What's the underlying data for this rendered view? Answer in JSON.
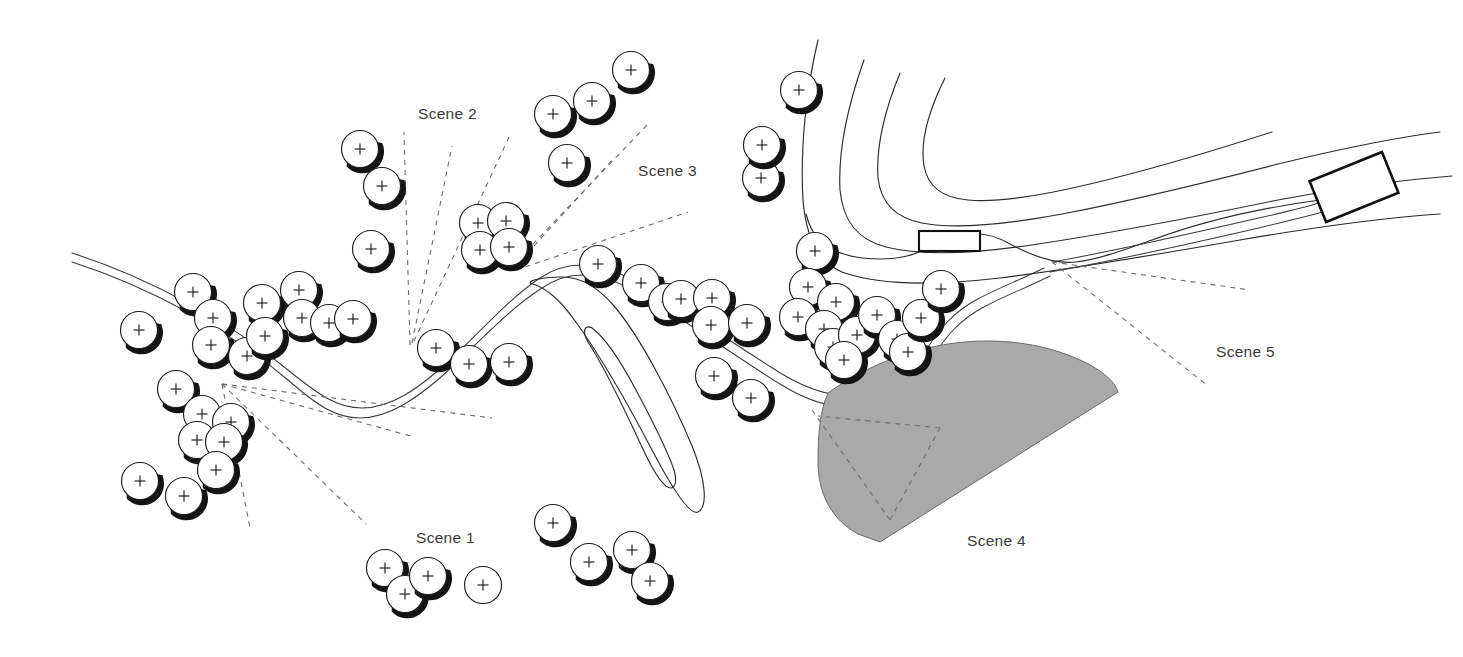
{
  "diagram": {
    "type": "topographic-map",
    "width": 1463,
    "height": 657,
    "background_color": "#ffffff"
  },
  "colors": {
    "background": "#ffffff",
    "contour_stroke": "#2b2b2b",
    "road_stroke": "#3a3a3a",
    "view_ray_stroke": "#6e6e6e",
    "scene4_fill": "#a9a9a9",
    "scene4_stroke": "#6a6a6a",
    "label_text": "#3b3b3b",
    "tree_fill": "#ffffff",
    "tree_stroke": "#1d1d1d",
    "tree_shadow": "#141414",
    "building_stroke": "#111111"
  },
  "labels": [
    {
      "id": "scene-1",
      "text": "Scene 1",
      "x": 416,
      "y": 543,
      "anchor": "start"
    },
    {
      "id": "scene-2",
      "text": "Scene 2",
      "x": 418,
      "y": 119,
      "anchor": "start"
    },
    {
      "id": "scene-3",
      "text": "Scene 3",
      "x": 638,
      "y": 176,
      "anchor": "start"
    },
    {
      "id": "scene-4",
      "text": "Scene 4",
      "x": 967,
      "y": 546,
      "anchor": "start"
    },
    {
      "id": "scene-5",
      "text": "Scene 5",
      "x": 1216,
      "y": 357,
      "anchor": "start"
    }
  ],
  "symbols": {
    "tree": {
      "name": "tree-symbol",
      "glyph": "+",
      "radius": 18.5,
      "count": 69
    },
    "building": {
      "name": "building-symbol",
      "shape": "rectangle"
    }
  },
  "trees": [
    [
      139,
      330
    ],
    [
      193,
      292
    ],
    [
      213,
      318
    ],
    [
      211,
      345
    ],
    [
      247,
      356
    ],
    [
      262,
      303
    ],
    [
      265,
      336
    ],
    [
      299,
      290
    ],
    [
      302,
      318
    ],
    [
      329,
      323
    ],
    [
      353,
      319
    ],
    [
      360,
      149
    ],
    [
      382,
      186
    ],
    [
      371,
      249
    ],
    [
      176,
      389
    ],
    [
      202,
      414
    ],
    [
      231,
      422
    ],
    [
      197,
      440
    ],
    [
      224,
      442
    ],
    [
      216,
      470
    ],
    [
      140,
      481
    ],
    [
      184,
      496
    ],
    [
      436,
      348
    ],
    [
      469,
      364
    ],
    [
      509,
      362
    ],
    [
      478,
      223
    ],
    [
      506,
      221
    ],
    [
      480,
      250
    ],
    [
      509,
      247
    ],
    [
      553,
      114
    ],
    [
      592,
      101
    ],
    [
      631,
      70
    ],
    [
      567,
      163
    ],
    [
      598,
      264
    ],
    [
      641,
      283
    ],
    [
      667,
      302
    ],
    [
      681,
      299
    ],
    [
      712,
      298
    ],
    [
      711,
      325
    ],
    [
      747,
      323
    ],
    [
      714,
      376
    ],
    [
      751,
      398
    ],
    [
      761,
      178
    ],
    [
      762,
      145
    ],
    [
      799,
      90
    ],
    [
      815,
      251
    ],
    [
      808,
      287
    ],
    [
      836,
      302
    ],
    [
      798,
      317
    ],
    [
      824,
      329
    ],
    [
      833,
      347
    ],
    [
      857,
      335
    ],
    [
      844,
      360
    ],
    [
      877,
      315
    ],
    [
      897,
      339
    ],
    [
      908,
      352
    ],
    [
      921,
      318
    ],
    [
      941,
      289
    ],
    [
      385,
      568
    ],
    [
      405,
      594
    ],
    [
      428,
      576
    ],
    [
      483,
      585
    ],
    [
      553,
      523
    ],
    [
      589,
      562
    ],
    [
      632,
      550
    ],
    [
      650,
      581
    ],
    [
      140,
      481
    ],
    [
      184,
      496
    ],
    [
      216,
      470
    ]
  ],
  "trees_no_shadow": [
    [
      483,
      585
    ]
  ],
  "view_cones": [
    {
      "id": "scene-1-cone",
      "apex": [
        222,
        384
      ],
      "rays": [
        [
          489,
          417
        ],
        [
          414,
          437
        ],
        [
          366,
          524
        ],
        [
          250,
          528
        ]
      ]
    },
    {
      "id": "scene-2-cone",
      "apex": [
        412,
        343
      ],
      "rays": [
        [
          404,
          135
        ],
        [
          450,
          147
        ],
        [
          508,
          136
        ]
      ]
    },
    {
      "id": "scene-3-cone",
      "apex": [
        512,
        266
      ],
      "rays": [
        [
          646,
          127
        ],
        [
          686,
          213
        ],
        [
          612,
          156
        ]
      ]
    },
    {
      "id": "scene-4-cone",
      "apex": [
        890,
        520
      ],
      "rays": [
        [
          938,
          429
        ],
        [
          812,
          411
        ]
      ]
    },
    {
      "id": "scene-5-cone",
      "apex": [
        1052,
        262
      ],
      "rays": [
        [
          1248,
          288
        ],
        [
          1206,
          383
        ]
      ]
    }
  ],
  "roads": [
    {
      "id": "main-road",
      "description": "double-line road running west to east across the map"
    },
    {
      "id": "east-road",
      "description": "double-line road branching north-east toward the building"
    }
  ],
  "contours": [
    {
      "id": "contour-ne-1",
      "description": "north-east ridge contour outermost"
    },
    {
      "id": "contour-ne-2",
      "description": "north-east ridge contour"
    },
    {
      "id": "contour-ne-3",
      "description": "north-east ridge contour"
    },
    {
      "id": "contour-ne-4",
      "description": "north-east ridge contour innermost"
    },
    {
      "id": "contour-valley-outer",
      "description": "central V-shaped valley contour outer"
    },
    {
      "id": "contour-valley-inner",
      "description": "central V-shaped valley contour inner"
    }
  ],
  "buildings": [
    {
      "id": "building-ne",
      "x": 1315,
      "y": 165,
      "width": 78,
      "height": 44,
      "rotation": -22
    },
    {
      "id": "building-mid",
      "x": 919,
      "y": 231,
      "width": 61,
      "height": 20,
      "rotation": 0
    }
  ]
}
